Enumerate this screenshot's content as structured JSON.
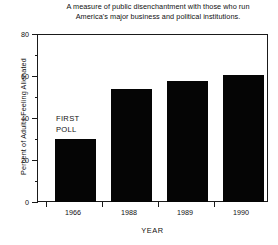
{
  "chart_data": {
    "type": "bar",
    "title": "A measure of public disenchantment with those who run America's major business and political institutions.",
    "title_lines": [
      "A  measure of public disenchantment with those who run",
      "America's major business and political institutions."
    ],
    "xlabel": "YEAR",
    "ylabel": "Percent of Adults Feeling Alienated",
    "categories": [
      "1966",
      "1988",
      "1989",
      "1990"
    ],
    "values": [
      30,
      54,
      58,
      61
    ],
    "ylim": [
      0,
      80
    ],
    "yticks": [
      0,
      20,
      40,
      60,
      80
    ],
    "ytick_labels": [
      "0",
      "20",
      "40",
      "60",
      "80"
    ],
    "yminor_ticks": [
      10,
      30,
      50,
      70
    ],
    "grid": false,
    "legend": false,
    "bar_color": "#050505",
    "frame_color": "#1a1a1a",
    "background": "#ffffff",
    "annotations": [
      {
        "name": "first-poll",
        "lines": [
          "FIRST",
          "POLL"
        ],
        "text": "FIRST POLL",
        "attached_to_category": "1966"
      }
    ]
  }
}
